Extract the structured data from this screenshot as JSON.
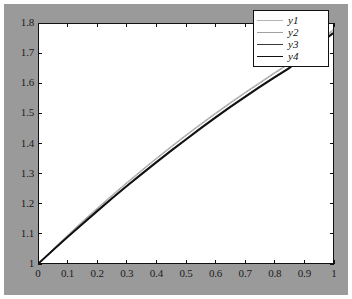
{
  "figure": {
    "background_color": "#9a9a9a",
    "axes_background_color": "#ffffff",
    "axes_border_color": "#111111"
  },
  "legend": {
    "position": "top-right",
    "entries": [
      {
        "label": "y1",
        "color": "#b4b4b4",
        "width": 1
      },
      {
        "label": "y2",
        "color": "#a0a0a0",
        "width": 1
      },
      {
        "label": "y3",
        "color": "#3a3a3a",
        "width": 1.6
      },
      {
        "label": "y4",
        "color": "#111111",
        "width": 1.8
      }
    ]
  },
  "chart_data": {
    "type": "line",
    "title": "",
    "xlabel": "",
    "ylabel": "",
    "xlim": [
      0,
      1
    ],
    "ylim": [
      1,
      1.8
    ],
    "grid": false,
    "legend_position": "upper right",
    "xticks": [
      0,
      0.1,
      0.2,
      0.3,
      0.4,
      0.5,
      0.6,
      0.7,
      0.8,
      0.9,
      1
    ],
    "xticklabels": [
      "0",
      "0.1",
      "0.2",
      "0.3",
      "0.4",
      "0.5",
      "0.6",
      "0.7",
      "0.8",
      "0.9",
      "1"
    ],
    "yticks": [
      1,
      1.1,
      1.2,
      1.3,
      1.4,
      1.5,
      1.6,
      1.7,
      1.8
    ],
    "yticklabels": [
      "1",
      "1.1",
      "1.2",
      "1.3",
      "1.4",
      "1.5",
      "1.6",
      "1.7",
      "1.8"
    ],
    "x": [
      0,
      0.05,
      0.1,
      0.15,
      0.2,
      0.25,
      0.3,
      0.35,
      0.4,
      0.45,
      0.5,
      0.55,
      0.6,
      0.65,
      0.7,
      0.75,
      0.8,
      0.85,
      0.9,
      0.95,
      1
    ],
    "series": [
      {
        "name": "y1",
        "color": "#b4b4b4",
        "width": 1,
        "values": [
          1.0,
          1.049,
          1.096,
          1.142,
          1.186,
          1.229,
          1.271,
          1.312,
          1.352,
          1.391,
          1.429,
          1.466,
          1.502,
          1.537,
          1.571,
          1.604,
          1.637,
          1.669,
          1.706,
          1.743,
          1.781
        ]
      },
      {
        "name": "y2",
        "color": "#a0a0a0",
        "width": 1,
        "values": [
          1.0,
          1.048,
          1.094,
          1.139,
          1.183,
          1.226,
          1.268,
          1.309,
          1.349,
          1.388,
          1.426,
          1.463,
          1.499,
          1.534,
          1.568,
          1.601,
          1.634,
          1.666,
          1.703,
          1.74,
          1.778
        ]
      },
      {
        "name": "y3",
        "color": "#3a3a3a",
        "width": 1.6,
        "values": [
          1.0,
          1.046,
          1.09,
          1.134,
          1.177,
          1.219,
          1.26,
          1.3,
          1.339,
          1.378,
          1.415,
          1.452,
          1.488,
          1.523,
          1.557,
          1.59,
          1.622,
          1.653,
          1.692,
          1.731,
          1.77
        ]
      },
      {
        "name": "y4",
        "color": "#111111",
        "width": 1.8,
        "values": [
          1.0,
          1.045,
          1.089,
          1.132,
          1.175,
          1.217,
          1.258,
          1.298,
          1.337,
          1.376,
          1.413,
          1.45,
          1.486,
          1.521,
          1.555,
          1.588,
          1.62,
          1.651,
          1.69,
          1.73,
          1.769
        ]
      }
    ]
  }
}
